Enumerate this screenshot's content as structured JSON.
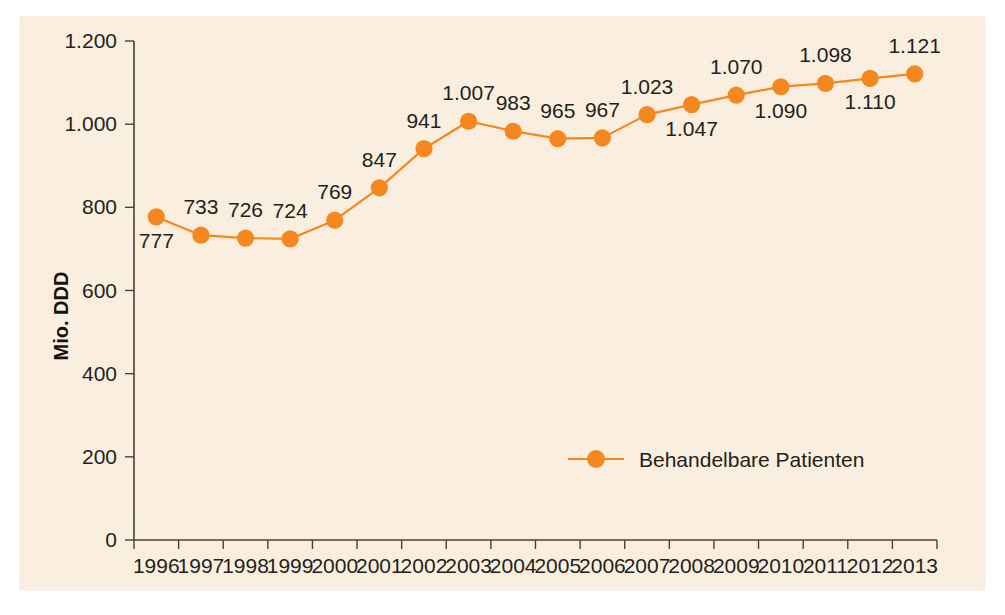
{
  "chart_data": {
    "type": "line",
    "title": "",
    "subtitle": "",
    "xlabel": "",
    "ylabel": "Mio. DDD",
    "categories": [
      "1996",
      "1997",
      "1998",
      "1999",
      "2000",
      "2001",
      "2002",
      "2003",
      "2004",
      "2005",
      "2006",
      "2007",
      "2008",
      "2009",
      "2010",
      "2011",
      "2012",
      "2013"
    ],
    "series": [
      {
        "name": "Behandelbare Patienten",
        "color": "#F5871F",
        "values": [
          777,
          733,
          726,
          724,
          769,
          847,
          941,
          1007,
          983,
          965,
          967,
          1023,
          1047,
          1070,
          1090,
          1098,
          1110,
          1121
        ],
        "value_labels": [
          "777",
          "733",
          "726",
          "724",
          "769",
          "847",
          "941",
          "1.007",
          "983",
          "965",
          "967",
          "1.023",
          "1.047",
          "1.070",
          "1.090",
          "1.098",
          "1.110",
          "1.121"
        ],
        "label_positions": [
          "below",
          "above",
          "above",
          "above",
          "above",
          "above",
          "above",
          "above",
          "above",
          "above",
          "above",
          "above",
          "below",
          "above",
          "below",
          "above",
          "below",
          "above"
        ]
      }
    ],
    "ylim": [
      0,
      1200
    ],
    "yticks": [
      0,
      200,
      400,
      600,
      800,
      1000,
      1200
    ],
    "ytick_labels": [
      "0",
      "200",
      "400",
      "600",
      "800",
      "1.000",
      "1.200"
    ],
    "grid": false,
    "legend_position": "inside-bottom-center",
    "legend_entries": [
      "Behandelbare Patienten"
    ]
  },
  "legend": {
    "entry_label": "Behandelbare Patienten"
  },
  "axes": {
    "y_title": "Mio. DDD"
  },
  "colors": {
    "accent": "#F5871F",
    "panel_background": "#FAEEDD",
    "axis": "#4A4036",
    "text": "#241F1B"
  }
}
